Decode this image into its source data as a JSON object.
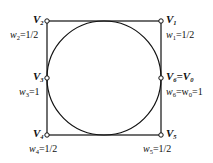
{
  "diagram": {
    "type": "rational-quadratic-circle-control-polygon",
    "square": {
      "x": 47,
      "y": 21,
      "size": 114
    },
    "circle": {
      "cx": 104,
      "cy": 78,
      "r": 57
    },
    "colors": {
      "stroke": "#111111",
      "background": "#ffffff",
      "point_fill": "#ffffff"
    },
    "vertices": [
      {
        "id": "V1",
        "label_main": "V",
        "label_sub": "1",
        "weight_label": "w",
        "weight_sub": "1",
        "weight_value": "=1/2",
        "x": 161,
        "y": 21
      },
      {
        "id": "V2",
        "label_main": "V",
        "label_sub": "2",
        "weight_label": "w",
        "weight_sub": "2",
        "weight_value": "=1/2",
        "x": 47,
        "y": 21
      },
      {
        "id": "V3",
        "label_main": "V",
        "label_sub": "3",
        "weight_label": "w",
        "weight_sub": "3",
        "weight_value": "=1",
        "x": 47,
        "y": 78
      },
      {
        "id": "V4",
        "label_main": "V",
        "label_sub": "4",
        "weight_label": "w",
        "weight_sub": "4",
        "weight_value": "=1/2",
        "x": 47,
        "y": 135
      },
      {
        "id": "V5",
        "label_main": "V",
        "label_sub": "5",
        "weight_label": "w",
        "weight_sub": "5",
        "weight_value": "=1/2",
        "x": 161,
        "y": 135
      },
      {
        "id": "V6=V0",
        "label_main": "V",
        "label_sub": "6",
        "label_eq": "=V",
        "label_sub2": "0",
        "weight_label": "w",
        "weight_sub": "6",
        "weight_mid": "=w",
        "weight_sub2": "0",
        "weight_value": "=1",
        "x": 161,
        "y": 78
      }
    ]
  }
}
